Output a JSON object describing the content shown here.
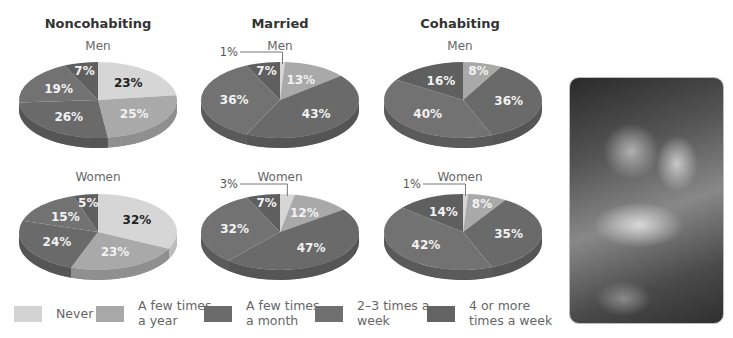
{
  "chart_data": {
    "type": "pie",
    "title": "",
    "slice_order": [
      "Never",
      "A few times a year",
      "A few times a month",
      "2–3 times a week",
      "4 or more times a week"
    ],
    "groups": [
      {
        "title": "Noncohabiting",
        "charts": [
          {
            "subtitle": "Men",
            "values": [
              23,
              25,
              26,
              19,
              7
            ]
          },
          {
            "subtitle": "Women",
            "values": [
              32,
              23,
              24,
              15,
              5
            ]
          }
        ]
      },
      {
        "title": "Married",
        "charts": [
          {
            "subtitle": "Men",
            "values": [
              1,
              13,
              43,
              36,
              7
            ]
          },
          {
            "subtitle": "Women",
            "values": [
              3,
              12,
              47,
              32,
              7
            ]
          }
        ]
      },
      {
        "title": "Cohabiting",
        "charts": [
          {
            "subtitle": "Men",
            "values": [
              0,
              8,
              36,
              40,
              16
            ]
          },
          {
            "subtitle": "Women",
            "values": [
              1,
              8,
              35,
              42,
              14
            ]
          }
        ]
      }
    ],
    "legend": [
      {
        "label": "Never",
        "color": "#d3d3d3"
      },
      {
        "label": "A few times\na year",
        "color": "#a8a8a8"
      },
      {
        "label": "A few times\na month",
        "color": "#6b6b6b"
      },
      {
        "label": "2–3 times  a\nweek",
        "color": "#707070"
      },
      {
        "label": "4 or more\ntimes a week",
        "color": "#636363"
      }
    ],
    "legend_position": "bottom"
  },
  "labels": {
    "groups": [
      "Noncohabiting",
      "Married",
      "Cohabiting"
    ],
    "men": "Men",
    "women": "Women"
  },
  "photo": {
    "description": "grayscale photo of a couple embracing"
  }
}
